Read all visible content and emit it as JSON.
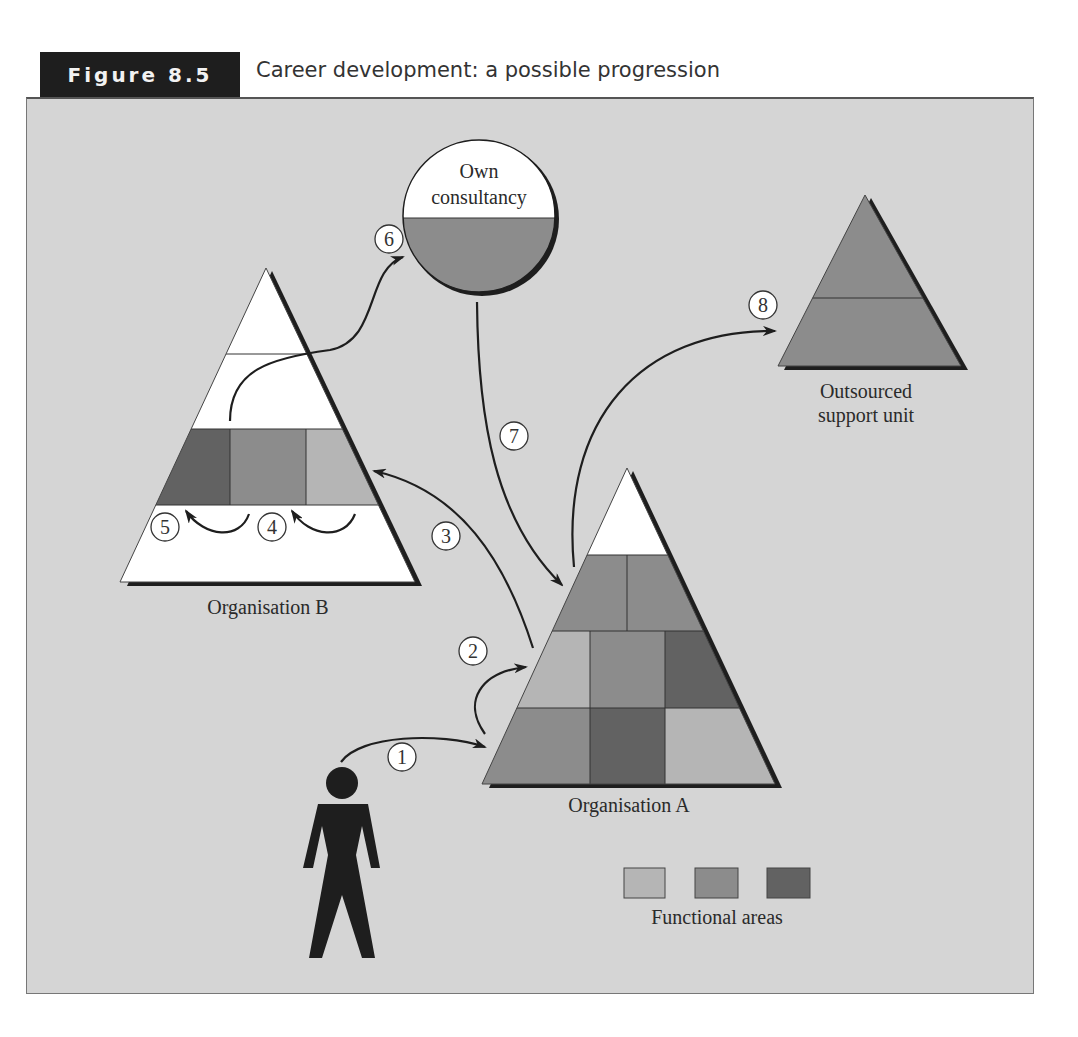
{
  "figure": {
    "label": "Figure 8.5",
    "title": "Career development: a possible progression"
  },
  "colors": {
    "background": "#d5d5d5",
    "light": "#b5b5b5",
    "mid": "#8c8c8c",
    "dark": "#626262",
    "white": "#ffffff",
    "ink": "#1e1e1e"
  },
  "nodes": {
    "consultancy": {
      "line1": "Own",
      "line2": "consultancy"
    },
    "org_b": {
      "label": "Organisation B"
    },
    "org_a": {
      "label": "Organisation A"
    },
    "outsourced": {
      "line1": "Outsourced",
      "line2": "support unit"
    }
  },
  "steps": [
    {
      "n": "1",
      "from": "person",
      "to": "Organisation A (entry level)"
    },
    {
      "n": "2",
      "from": "Organisation A level 1",
      "to": "Organisation A level 2"
    },
    {
      "n": "3",
      "from": "Organisation A",
      "to": "Organisation B"
    },
    {
      "n": "4",
      "from": "Organisation B functional area",
      "to": "adjacent functional area"
    },
    {
      "n": "5",
      "from": "Organisation B functional area",
      "to": "adjacent functional area"
    },
    {
      "n": "6",
      "from": "Organisation B",
      "to": "Own consultancy"
    },
    {
      "n": "7",
      "from": "Own consultancy",
      "to": "Organisation A"
    },
    {
      "n": "8",
      "from": "Organisation A",
      "to": "Outsourced support unit"
    }
  ],
  "legend": {
    "label": "Functional areas",
    "swatches": [
      "light",
      "mid",
      "dark"
    ]
  }
}
